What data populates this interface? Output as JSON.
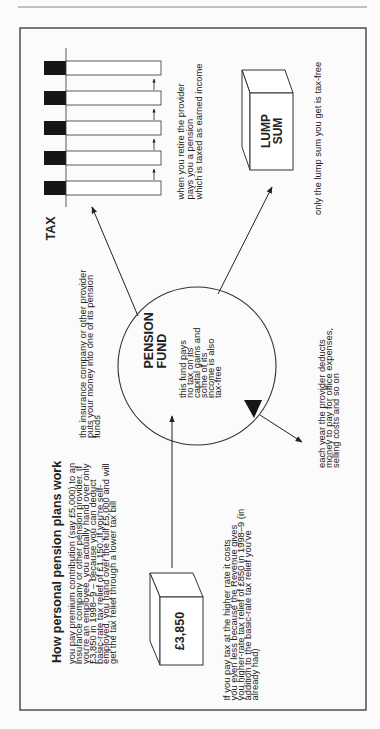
{
  "page": {
    "title": "How personal pension plans work"
  },
  "intro": {
    "lines": [
      "you pay premium contribution (say £5,000) to an",
      "insurance company or other pension provider. If",
      "you're an employee, you actually hand over only",
      "£3,850 in 1998–9 – because you can deduct",
      "basic-rate tax relief of £1,150. If you're self-",
      "employed, you hand over the full £5,000 and will",
      "get the tax relief through a lower tax bill"
    ]
  },
  "payment_box": {
    "label": "£3,850"
  },
  "higher_rate_note": {
    "lines": [
      "If you pay tax at the higher rate it costs",
      "you even less because the Revenue gives",
      "you higher-rate tax relief of £850 in 1998–9 (in",
      "addition to the basic-rate tax relief you've",
      "already had)"
    ]
  },
  "provider_note": {
    "lines": [
      "the insurance company or other provider",
      "puts your money into one of its pension",
      "funds"
    ]
  },
  "fund": {
    "title_lines": [
      "PENSION",
      "FUND"
    ],
    "desc_lines": [
      "this fund pays",
      "no tax on its",
      "capital gains and",
      "some of its",
      "income is also",
      "tax-free"
    ]
  },
  "charges_note": {
    "lines": [
      "each year the provider deducts",
      "money to pay for office expenses,",
      "selling costs and so on"
    ]
  },
  "tax_diagram": {
    "label": "TAX",
    "bar_count": 5
  },
  "pension_note": {
    "lines": [
      "when you retire the provider",
      "pays you a pension",
      "which is taxed as earned income"
    ]
  },
  "lump_sum_box": {
    "label_lines": [
      "LUMP",
      "SUM"
    ]
  },
  "lump_sum_note": {
    "text": "only the lump sum you get is tax-free"
  },
  "colors": {
    "ink": "#222222",
    "paper": "#fbfbfb",
    "rule": "#888888"
  }
}
